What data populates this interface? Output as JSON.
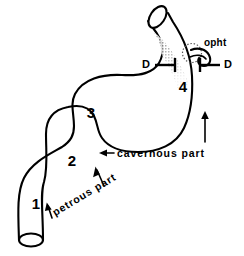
{
  "figure": {
    "background_color": "#ffffff",
    "ink_color": "#000000",
    "shade_color": "#b9b9b9"
  },
  "segments": [
    {
      "id": "segment-1",
      "number": "1",
      "x": 36,
      "y": 204
    },
    {
      "id": "segment-2",
      "number": "2",
      "x": 72,
      "y": 161
    },
    {
      "id": "segment-3",
      "number": "3",
      "x": 91,
      "y": 113
    },
    {
      "id": "segment-4",
      "number": "4",
      "x": 183,
      "y": 87
    }
  ],
  "markers": {
    "dural_left": {
      "label": "D",
      "x": 147,
      "y": 65
    },
    "dural_right": {
      "label": "D",
      "x": 225,
      "y": 65
    }
  },
  "labels": {
    "ophthalmic": {
      "text": "opht",
      "x": 205,
      "y": 43
    },
    "cavernous": {
      "text": "cavernous part",
      "x": 116,
      "y": 148
    },
    "petrous": {
      "text": "petrous part",
      "x": 56,
      "y": 206,
      "rotation_deg": -31
    }
  },
  "annotations": {
    "flow_arrow": {
      "name": "flow-direction-arrow",
      "direction": "up",
      "x": 205,
      "y": 121
    },
    "cavernous_arrow": {
      "name": "cavernous-pointer-arrow",
      "direction": "left"
    },
    "petrous_arrows": {
      "name": "petrous-pointer-arrows",
      "count": 2
    }
  }
}
